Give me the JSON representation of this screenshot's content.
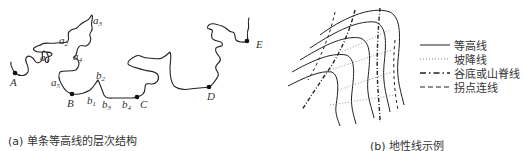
{
  "figure_a": {
    "caption": "(a) 单条等高线的层次结构",
    "points": [
      {
        "id": "A",
        "label": "A",
        "x": 15,
        "y": 73
      },
      {
        "id": "B",
        "label": "B",
        "x": 72,
        "y": 94
      },
      {
        "id": "C",
        "label": "C",
        "x": 137,
        "y": 97
      },
      {
        "id": "D",
        "label": "D",
        "x": 209,
        "y": 87
      },
      {
        "id": "E",
        "label": "E",
        "x": 247,
        "y": 41
      }
    ],
    "labels": {
      "a1": "a",
      "a1_sub": "1",
      "a2": "a",
      "a2_sub": "2",
      "a3": "a",
      "a3_sub": "3",
      "a4": "a",
      "a4_sub": "4",
      "a5": "a",
      "a5_sub": "5",
      "b1": "b",
      "b1_sub": "1",
      "b2": "b",
      "b2_sub": "2",
      "b3": "b",
      "b3_sub": "3",
      "b4": "b",
      "b4_sub": "4"
    }
  },
  "figure_b": {
    "caption": "(b) 地性线示例",
    "legend": [
      {
        "style": "solid",
        "label": "等高线"
      },
      {
        "style": "dotted",
        "label": "坡降线"
      },
      {
        "style": "dash-dot",
        "label": "谷底或山脊线"
      },
      {
        "style": "dashed",
        "label": "拐点连线"
      }
    ]
  }
}
